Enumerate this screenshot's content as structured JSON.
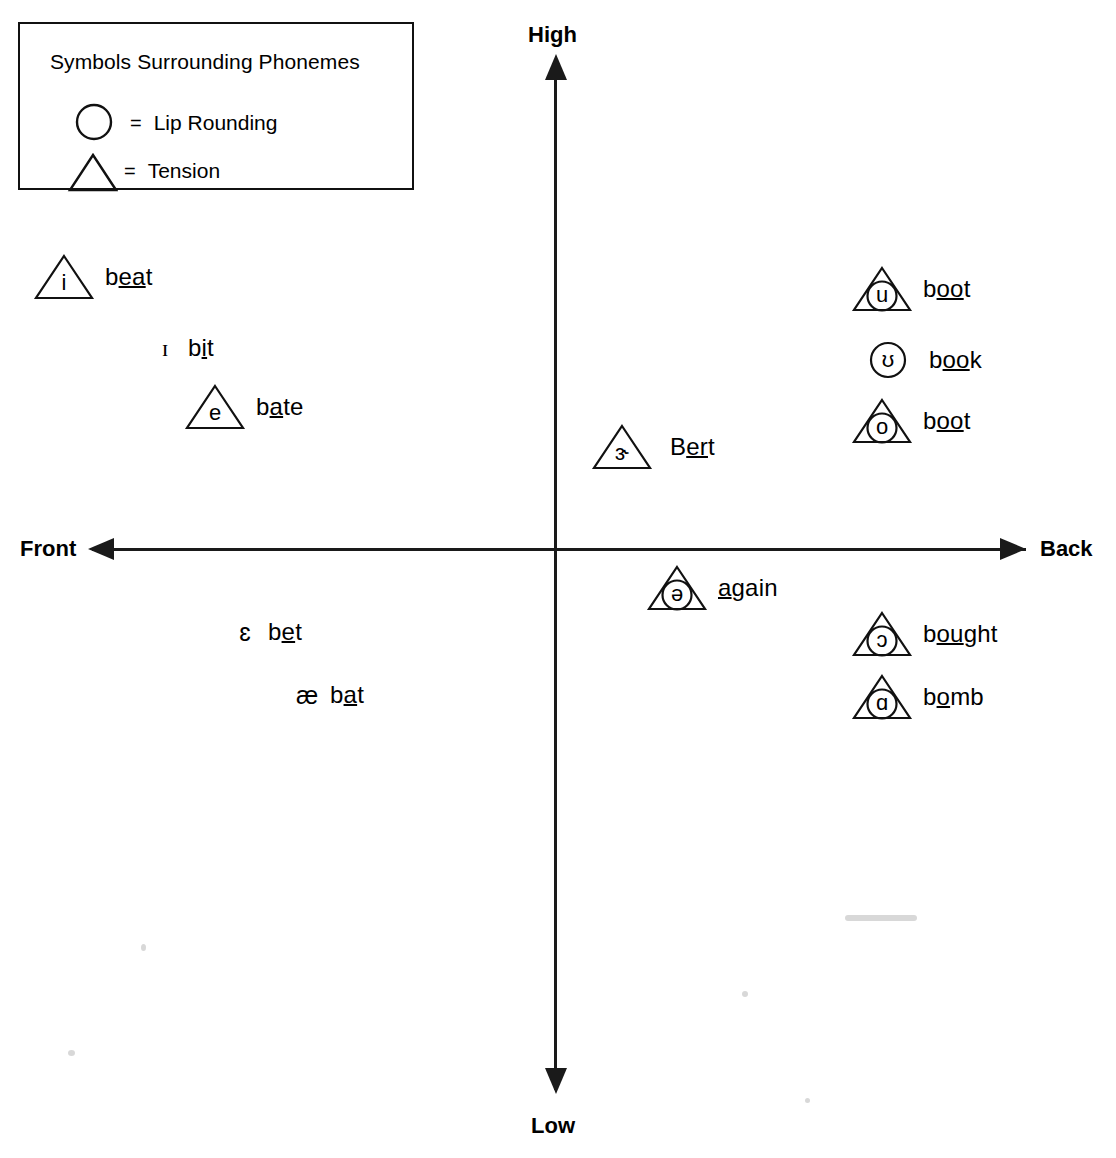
{
  "chart_data": {
    "type": "scatter",
    "xlabel": "Front – Back (tongue advancement)",
    "ylabel": "High – Low (tongue height)",
    "axes": {
      "top": "High",
      "bottom": "Low",
      "left": "Front",
      "right": "Back"
    },
    "legend": {
      "title": "Symbols Surrounding Phonemes",
      "entries": [
        {
          "shape": "circle",
          "equals": "=",
          "label": "Lip Rounding"
        },
        {
          "shape": "triangle",
          "equals": "=",
          "label": "Tension"
        }
      ]
    },
    "points": [
      {
        "symbol": "i",
        "word": "beat",
        "word_pre": "b",
        "word_mid": "ea",
        "word_post": "t",
        "shapes": [
          "triangle"
        ],
        "x": 33,
        "y": 253
      },
      {
        "symbol": "ɪ",
        "word": "bit",
        "word_pre": "b",
        "word_mid": "i",
        "word_post": "t",
        "shapes": [],
        "x": 152,
        "y": 326
      },
      {
        "symbol": "e",
        "word": "bate",
        "word_pre": "b",
        "word_mid": "a",
        "word_post": "te",
        "shapes": [
          "triangle"
        ],
        "x": 184,
        "y": 383
      },
      {
        "symbol": "ɛ",
        "word": "bet",
        "word_pre": "b",
        "word_mid": "e",
        "word_post": "t",
        "shapes": [],
        "x": 232,
        "y": 610
      },
      {
        "symbol": "æ",
        "word": "bat",
        "word_pre": "b",
        "word_mid": "a",
        "word_post": "t",
        "shapes": [],
        "x": 294,
        "y": 673
      },
      {
        "symbol": "ɝ",
        "word": "Bert",
        "word_pre": "B",
        "word_mid": "er",
        "word_post": "t",
        "shapes": [
          "triangle"
        ],
        "x": 588,
        "y": 423
      },
      {
        "symbol": "ə",
        "word": "again",
        "word_pre": "",
        "word_mid": "a",
        "word_post": "gain",
        "shapes": [
          "triangle",
          "circle"
        ],
        "x": 646,
        "y": 564
      },
      {
        "symbol": "u",
        "word": "boot",
        "word_pre": "b",
        "word_mid": "oo",
        "word_post": "t",
        "shapes": [
          "triangle",
          "circle"
        ],
        "x": 851,
        "y": 265
      },
      {
        "symbol": "ʊ",
        "word": "book",
        "word_pre": "b",
        "word_mid": "oo",
        "word_post": "k",
        "shapes": [
          "circle"
        ],
        "x": 857,
        "y": 336
      },
      {
        "symbol": "o",
        "word": "boot",
        "word_pre": "b",
        "word_mid": "oo",
        "word_post": "t",
        "shapes": [
          "triangle",
          "circle"
        ],
        "x": 851,
        "y": 397
      },
      {
        "symbol": "ɔ",
        "word": "bought",
        "word_pre": "b",
        "word_mid": "ou",
        "word_post": "ght",
        "shapes": [
          "triangle",
          "circle"
        ],
        "x": 851,
        "y": 610
      },
      {
        "symbol": "ɑ",
        "word": "bomb",
        "word_pre": "b",
        "word_mid": "o",
        "word_post": "mb",
        "shapes": [
          "triangle",
          "circle"
        ],
        "x": 851,
        "y": 673
      }
    ],
    "colors": {
      "ink": "#000000",
      "axis": "#1a1a1a",
      "background": "#ffffff"
    },
    "grid": false,
    "legend_position": "top-left"
  }
}
